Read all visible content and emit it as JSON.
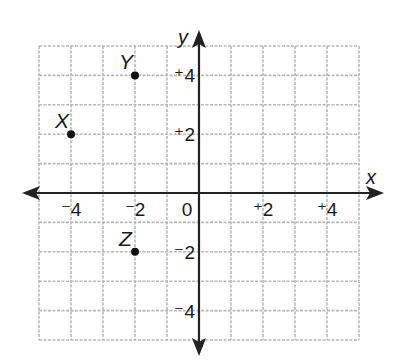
{
  "chart_data": {
    "type": "scatter",
    "title": "",
    "xlabel": "x",
    "ylabel": "y",
    "xlim": [
      -5,
      5
    ],
    "ylim": [
      -5,
      5
    ],
    "grid": true,
    "grid_step": 1,
    "x_ticks": [
      {
        "value": -4,
        "label": "⁻4"
      },
      {
        "value": -2,
        "label": "⁻2"
      },
      {
        "value": 0,
        "label": "0"
      },
      {
        "value": 2,
        "label": "⁺2"
      },
      {
        "value": 4,
        "label": "⁺4"
      }
    ],
    "y_ticks": [
      {
        "value": 4,
        "label": "⁺4"
      },
      {
        "value": 2,
        "label": "⁺2"
      },
      {
        "value": -2,
        "label": "⁻2"
      },
      {
        "value": -4,
        "label": "⁻4"
      }
    ],
    "points": [
      {
        "label": "X",
        "x": -4,
        "y": 2
      },
      {
        "label": "Y",
        "x": -2,
        "y": 4
      },
      {
        "label": "Z",
        "x": -2,
        "y": -2
      }
    ],
    "colors": {
      "grid": "#b8b8b8",
      "axis": "#222222",
      "point": "#111111"
    }
  }
}
